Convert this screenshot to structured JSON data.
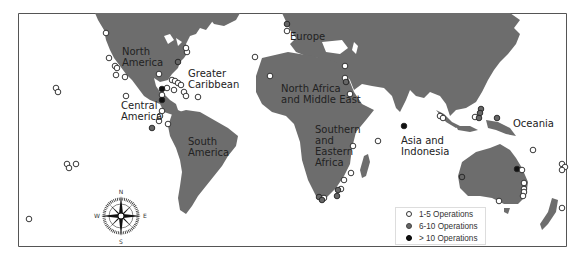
{
  "map": {
    "regions": [
      {
        "id": "north-america",
        "label": "North America",
        "lines": [
          "North",
          "America"
        ],
        "x": 122,
        "y": 46
      },
      {
        "id": "greater-caribbean",
        "label": "Greater Caribbean",
        "lines": [
          "Greater",
          "Caribbean"
        ],
        "x": 188,
        "y": 68
      },
      {
        "id": "central-america",
        "label": "Central America",
        "lines": [
          "Central",
          "America"
        ],
        "x": 121,
        "y": 100
      },
      {
        "id": "south-america",
        "label": "South America",
        "lines": [
          "South",
          "America"
        ],
        "x": 188,
        "y": 136
      },
      {
        "id": "europe",
        "label": "Europe",
        "lines": [
          "Europe"
        ],
        "x": 290,
        "y": 31
      },
      {
        "id": "north-africa-middle-east",
        "label": "North Africa and Middle East",
        "lines": [
          "North Africa",
          "and Middle East"
        ],
        "x": 281,
        "y": 83
      },
      {
        "id": "southern-eastern-africa",
        "label": "Southern and Eastern Africa",
        "lines": [
          "Southern",
          "and",
          "Eastern",
          "Africa"
        ],
        "x": 315,
        "y": 124
      },
      {
        "id": "asia-indonesia",
        "label": "Asia and Indonesia",
        "lines": [
          "Asia and",
          "Indonesia"
        ],
        "x": 401,
        "y": 135
      },
      {
        "id": "oceania",
        "label": "Oceania",
        "lines": [
          "Oceania"
        ],
        "x": 513,
        "y": 118
      }
    ],
    "compass": {
      "n": "N",
      "s": "S",
      "e": "E",
      "w": "W"
    }
  },
  "legend": {
    "items": [
      {
        "label": "1-5 Operations",
        "class": "small"
      },
      {
        "label": "6-10 Operations",
        "class": "mid"
      },
      {
        "label": "> 10 Operations",
        "class": "large"
      }
    ]
  },
  "colors": {
    "land": "#6d6d6d",
    "water": "#ffffff",
    "small": "#ffffff",
    "mid": "#666666",
    "large": "#111111"
  },
  "points": [
    {
      "x": 106,
      "y": 33,
      "c": "s"
    },
    {
      "x": 109,
      "y": 58,
      "c": "s"
    },
    {
      "x": 115,
      "y": 66,
      "c": "s"
    },
    {
      "x": 117,
      "y": 68,
      "c": "s"
    },
    {
      "x": 116,
      "y": 75,
      "c": "s"
    },
    {
      "x": 125,
      "y": 77,
      "c": "s"
    },
    {
      "x": 187,
      "y": 52,
      "c": "s"
    },
    {
      "x": 186,
      "y": 48,
      "c": "s"
    },
    {
      "x": 178,
      "y": 62,
      "c": "m"
    },
    {
      "x": 159,
      "y": 74,
      "c": "s"
    },
    {
      "x": 172,
      "y": 80,
      "c": "s"
    },
    {
      "x": 175,
      "y": 81,
      "c": "s"
    },
    {
      "x": 178,
      "y": 83,
      "c": "s"
    },
    {
      "x": 181,
      "y": 85,
      "c": "s"
    },
    {
      "x": 174,
      "y": 90,
      "c": "s"
    },
    {
      "x": 184,
      "y": 92,
      "c": "s"
    },
    {
      "x": 167,
      "y": 88,
      "c": "s"
    },
    {
      "x": 198,
      "y": 97,
      "c": "s"
    },
    {
      "x": 186,
      "y": 96,
      "c": "s"
    },
    {
      "x": 162,
      "y": 89,
      "c": "l"
    },
    {
      "x": 162,
      "y": 95,
      "c": "s"
    },
    {
      "x": 162,
      "y": 100,
      "c": "l"
    },
    {
      "x": 162,
      "y": 111,
      "c": "s"
    },
    {
      "x": 160,
      "y": 116,
      "c": "s"
    },
    {
      "x": 126,
      "y": 96,
      "c": "s"
    },
    {
      "x": 159,
      "y": 121,
      "c": "s"
    },
    {
      "x": 168,
      "y": 124,
      "c": "s"
    },
    {
      "x": 152,
      "y": 128,
      "c": "m"
    },
    {
      "x": 56,
      "y": 88,
      "c": "s"
    },
    {
      "x": 58,
      "y": 92,
      "c": "s"
    },
    {
      "x": 67,
      "y": 164,
      "c": "s"
    },
    {
      "x": 69,
      "y": 168,
      "c": "s"
    },
    {
      "x": 76,
      "y": 164,
      "c": "s"
    },
    {
      "x": 29,
      "y": 219,
      "c": "s"
    },
    {
      "x": 255,
      "y": 57,
      "c": "s"
    },
    {
      "x": 270,
      "y": 76,
      "c": "s"
    },
    {
      "x": 287,
      "y": 24,
      "c": "m"
    },
    {
      "x": 287,
      "y": 31,
      "c": "s"
    },
    {
      "x": 345,
      "y": 66,
      "c": "s"
    },
    {
      "x": 345,
      "y": 78,
      "c": "s"
    },
    {
      "x": 346,
      "y": 82,
      "c": "m"
    },
    {
      "x": 350,
      "y": 94,
      "c": "s"
    },
    {
      "x": 353,
      "y": 146,
      "c": "s"
    },
    {
      "x": 351,
      "y": 173,
      "c": "s"
    },
    {
      "x": 344,
      "y": 180,
      "c": "s"
    },
    {
      "x": 341,
      "y": 189,
      "c": "s"
    },
    {
      "x": 337,
      "y": 196,
      "c": "m"
    },
    {
      "x": 338,
      "y": 190,
      "c": "m"
    },
    {
      "x": 319,
      "y": 197,
      "c": "m"
    },
    {
      "x": 321,
      "y,": 199,
      "c": "m"
    },
    {
      "x": 324,
      "y": 198,
      "c": "s"
    },
    {
      "x": 322,
      "y": 200,
      "c": "m"
    },
    {
      "x": 378,
      "y": 141,
      "c": "s"
    },
    {
      "x": 404,
      "y": 126,
      "c": "l"
    },
    {
      "x": 440,
      "y": 116,
      "c": "s"
    },
    {
      "x": 443,
      "y": 118,
      "c": "s"
    },
    {
      "x": 481,
      "y": 109,
      "c": "m"
    },
    {
      "x": 480,
      "y": 113,
      "c": "m"
    },
    {
      "x": 475,
      "y": 117,
      "c": "s"
    },
    {
      "x": 479,
      "y": 118,
      "c": "m"
    },
    {
      "x": 497,
      "y": 118,
      "c": "m"
    },
    {
      "x": 533,
      "y": 150,
      "c": "s"
    },
    {
      "x": 517,
      "y": 169,
      "c": "l"
    },
    {
      "x": 522,
      "y": 170,
      "c": "s"
    },
    {
      "x": 462,
      "y": 177,
      "c": "m"
    },
    {
      "x": 524,
      "y": 183,
      "c": "s"
    },
    {
      "x": 524,
      "y": 189,
      "c": "s"
    },
    {
      "x": 524,
      "y": 192,
      "c": "s"
    },
    {
      "x": 523,
      "y": 196,
      "c": "s"
    },
    {
      "x": 499,
      "y": 201,
      "c": "s"
    },
    {
      "x": 562,
      "y": 164,
      "c": "s"
    },
    {
      "x": 565,
      "y": 167,
      "c": "s"
    },
    {
      "x": 562,
      "y": 170,
      "c": "s"
    },
    {
      "x": 562,
      "y": 208,
      "c": "s"
    }
  ]
}
